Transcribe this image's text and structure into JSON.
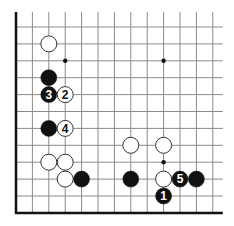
{
  "board": {
    "colors": {
      "background": "#ffffff",
      "grid": "#8a8a8a",
      "edge": "#111111",
      "black_stone": "#111111",
      "white_stone": "#ffffff",
      "white_stone_outline": "#333333",
      "star_point": "#111111"
    },
    "origin_x": 16,
    "origin_y": 27,
    "spacing_x": 16.4,
    "spacing_y": 16.9,
    "columns": 13,
    "rows": 12,
    "left_edge": true,
    "bottom_edge": true,
    "line_extend_top": 15,
    "line_extend_right": 10,
    "stone_radius": 8,
    "star_points": [
      {
        "col": 3,
        "row": 2
      },
      {
        "col": 9,
        "row": 2
      },
      {
        "col": 9,
        "row": 8
      }
    ],
    "stones": [
      {
        "col": 2,
        "row": 1,
        "color": "white",
        "label": ""
      },
      {
        "col": 2,
        "row": 3,
        "color": "black",
        "label": ""
      },
      {
        "col": 2,
        "row": 4,
        "color": "black",
        "label": "3"
      },
      {
        "col": 3,
        "row": 4,
        "color": "white",
        "label": "2"
      },
      {
        "col": 2,
        "row": 6,
        "color": "black",
        "label": ""
      },
      {
        "col": 3,
        "row": 6,
        "color": "white",
        "label": "4"
      },
      {
        "col": 2,
        "row": 8,
        "color": "white",
        "label": ""
      },
      {
        "col": 3,
        "row": 8,
        "color": "white",
        "label": ""
      },
      {
        "col": 3,
        "row": 9,
        "color": "white",
        "label": ""
      },
      {
        "col": 4,
        "row": 9,
        "color": "black",
        "label": ""
      },
      {
        "col": 7,
        "row": 7,
        "color": "white",
        "label": ""
      },
      {
        "col": 9,
        "row": 7,
        "color": "white",
        "label": ""
      },
      {
        "col": 7,
        "row": 9,
        "color": "black",
        "label": ""
      },
      {
        "col": 9,
        "row": 9,
        "color": "white",
        "label": ""
      },
      {
        "col": 10,
        "row": 9,
        "color": "black",
        "label": "5"
      },
      {
        "col": 11,
        "row": 9,
        "color": "black",
        "label": ""
      },
      {
        "col": 9,
        "row": 10,
        "color": "black",
        "label": "1"
      }
    ]
  }
}
